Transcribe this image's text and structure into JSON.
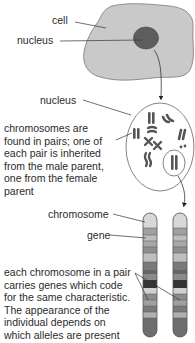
{
  "labels": {
    "cell": "cell",
    "nucleus_top": "nucleus",
    "nucleus_mid": "nucleus",
    "chromosome": "chromosome",
    "gene": "gene"
  },
  "descriptions": {
    "chromosome_pairs": "chromosomes are\nfound in pairs; one of\neach pair is inherited\nfrom the male parent,\none from the female\nparent",
    "alleles": "each chromosome in a pair\ncarries genes which code\nfor the same characteristic.\nThe appearance of the\nindividual depends on\nwhich alleles are present"
  },
  "colors": {
    "cell_fill": "#c9c9c9",
    "nucleus_fill": "#5e5e5e",
    "outline": "#555555",
    "chromosome_dark": "#3a3a3a"
  }
}
